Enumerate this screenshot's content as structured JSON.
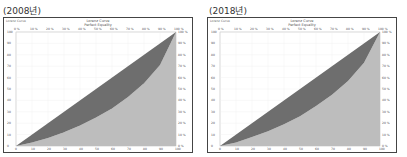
{
  "panels": [
    {
      "year_label": "(2008년)",
      "header": "Lorenz Curve",
      "title": "Lorenz Curve",
      "subtitle": "Perfect Equality"
    },
    {
      "year_label": "(2018년)",
      "header": "Lorenz Curve",
      "title": "Lorenz Curve",
      "subtitle": "Perfect Equality"
    }
  ],
  "colors": {
    "equality_area": "#6e6e6e",
    "under_curve": "#bdbdbd",
    "frame": "#444444"
  },
  "chart_data": [
    {
      "type": "area",
      "title": "Lorenz Curve (2008)",
      "xlabel": "Cumulative % of population",
      "ylabel": "Cumulative % of income",
      "xlim": [
        0,
        100
      ],
      "ylim": [
        0,
        100
      ],
      "x": [
        0,
        10,
        20,
        30,
        40,
        50,
        60,
        70,
        80,
        90,
        100
      ],
      "series": [
        {
          "name": "Perfect Equality",
          "values": [
            0,
            10,
            20,
            30,
            40,
            50,
            60,
            70,
            80,
            90,
            100
          ]
        },
        {
          "name": "Lorenz Curve",
          "values": [
            0,
            3,
            7,
            12,
            18,
            25,
            33,
            43,
            55,
            71,
            100
          ]
        }
      ]
    },
    {
      "type": "area",
      "title": "Lorenz Curve (2018)",
      "xlabel": "Cumulative % of population",
      "ylabel": "Cumulative % of income",
      "xlim": [
        0,
        100
      ],
      "ylim": [
        0,
        100
      ],
      "x": [
        0,
        10,
        20,
        30,
        40,
        50,
        60,
        70,
        80,
        90,
        100
      ],
      "series": [
        {
          "name": "Perfect Equality",
          "values": [
            0,
            10,
            20,
            30,
            40,
            50,
            60,
            70,
            80,
            90,
            100
          ]
        },
        {
          "name": "Lorenz Curve",
          "values": [
            0,
            3,
            8,
            13,
            19,
            26,
            35,
            45,
            57,
            73,
            100
          ]
        }
      ]
    }
  ]
}
